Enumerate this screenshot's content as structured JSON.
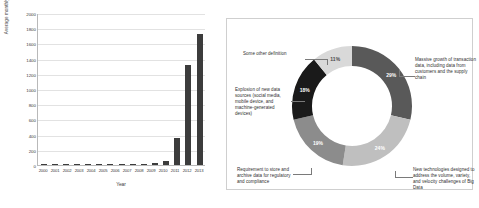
{
  "chart_data": [
    {
      "type": "bar",
      "title": "",
      "xlabel": "Year",
      "ylabel": "Average monthly frequency",
      "categories": [
        "2000",
        "2001",
        "2002",
        "2003",
        "2004",
        "2005",
        "2006",
        "2007",
        "2008",
        "2009",
        "2010",
        "2011",
        "2012",
        "2013"
      ],
      "values": [
        3,
        3,
        3,
        3,
        5,
        7,
        9,
        8,
        9,
        10,
        18,
        48,
        350,
        1310,
        1720
      ],
      "series": [
        {
          "name": "Average monthly frequency",
          "values": [
            3,
            4,
            4,
            4,
            6,
            9,
            11,
            9,
            10,
            12,
            22,
            55,
            350,
            1310,
            1720
          ]
        }
      ],
      "yticks": [
        0,
        200,
        400,
        600,
        800,
        1000,
        1200,
        1400,
        1600,
        1800,
        2000
      ],
      "ylim": [
        0,
        2000
      ],
      "grid": true,
      "bar_color": "#3c3c3c"
    },
    {
      "type": "pie",
      "variant": "donut",
      "title": "",
      "legend_position": "callouts",
      "labels": [
        "Massive growth of transaction data, including data from customers and the supply chain",
        "New technologies designed to address the volume, variety, and velocity challenges of Big Data",
        "Requirement to store and archive data for regulatory and compliance",
        "Explosion of new data sources (social media, mobile device, and machine-generated devices)",
        "Some other definition"
      ],
      "values": [
        29,
        24,
        19,
        18,
        11
      ],
      "value_labels": [
        "29%",
        "24%",
        "19%",
        "18%",
        "11%"
      ],
      "colors": [
        "#595959",
        "#bfbfbf",
        "#8c8c8c",
        "#1a1a1a",
        "#d9d9d9"
      ]
    }
  ],
  "barchart": {
    "name": "average-monthly-frequency-by-year",
    "ylabel": "Average monthly frequency",
    "xlabel": "Year",
    "yticks": [
      "2000",
      "1800",
      "1600",
      "1400",
      "1200",
      "1000",
      "800",
      "600",
      "400",
      "200",
      "0"
    ],
    "xticks": [
      "2000",
      "2001",
      "2002",
      "2003",
      "2004",
      "2005",
      "2006",
      "2007",
      "2008",
      "2009",
      "2010",
      "2011",
      "2012",
      "2013"
    ]
  },
  "donut": {
    "segments": [
      {
        "pct": "29%",
        "color": "#595959",
        "label": "Massive growth of transaction data, including data from customers and the supply chain"
      },
      {
        "pct": "24%",
        "color": "#bfbfbf",
        "label": "New technologies designed to address the volume, variety, and velocity challenges of Big Data"
      },
      {
        "pct": "19%",
        "color": "#8c8c8c",
        "label": "Requirement to store and archive data for regulatory and compliance"
      },
      {
        "pct": "18%",
        "color": "#1a1a1a",
        "label": "Explosion of new data sources (social media, mobile device, and machine-generated devices)"
      },
      {
        "pct": "11%",
        "color": "#d9d9d9",
        "label": "Some other definition"
      }
    ]
  }
}
